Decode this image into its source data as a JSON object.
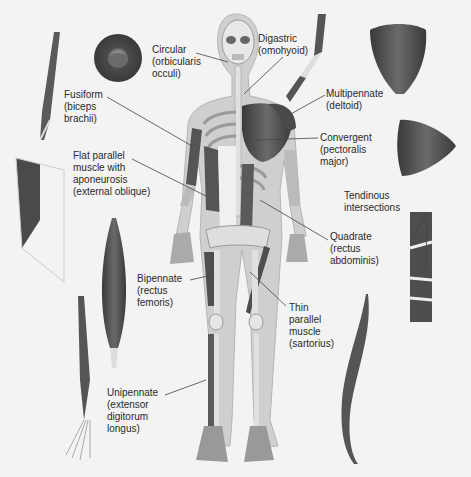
{
  "figure": {
    "type": "anatomical-diagram",
    "color_scheme": "grayscale",
    "colors": {
      "background": "#f3f3f3",
      "muscle": "#5a5a5a",
      "muscle_dark": "#3c3c3c",
      "bone": "#d9d9d9",
      "skin": "#c9c9c9",
      "text": "#2a2a2a",
      "leader": "#444444"
    }
  },
  "labels": [
    {
      "id": "circular",
      "lines": [
        "Circular",
        "(orbicularis",
        "occuli)"
      ]
    },
    {
      "id": "digastric",
      "lines": [
        "Digastric",
        "(omohyoid)"
      ]
    },
    {
      "id": "fusiform",
      "lines": [
        "Fusiform",
        "(biceps",
        "brachii)"
      ]
    },
    {
      "id": "multipennate",
      "lines": [
        "Multipennate",
        "(deltoid)"
      ]
    },
    {
      "id": "convergent",
      "lines": [
        "Convergent",
        "(pectoralis",
        "major)"
      ]
    },
    {
      "id": "flat-parallel",
      "lines": [
        "Flat parallel",
        "muscle with",
        "aponeurosis",
        "(external oblique)"
      ]
    },
    {
      "id": "tendinous",
      "lines": [
        "Tendinous",
        "intersections"
      ]
    },
    {
      "id": "quadrate",
      "lines": [
        "Quadrate",
        "(rectus",
        "abdominis)"
      ]
    },
    {
      "id": "bipennate",
      "lines": [
        "Bipennate",
        "(rectus",
        "femoris)"
      ]
    },
    {
      "id": "thin-parallel",
      "lines": [
        "Thin",
        "parallel",
        "muscle",
        "(sartorius)"
      ]
    },
    {
      "id": "unipennate",
      "lines": [
        "Unipennate",
        "(extensor",
        "digitorum",
        "longus)"
      ]
    }
  ]
}
